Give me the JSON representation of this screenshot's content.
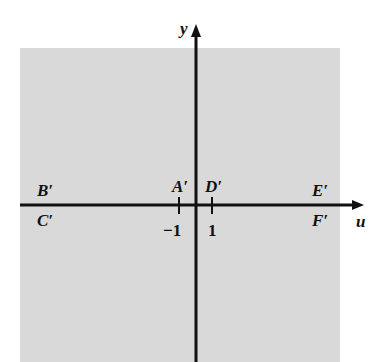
{
  "diagram": {
    "title": "",
    "region": {
      "color": "#d9d9d9"
    },
    "axes": {
      "horizontal_label": "u",
      "vertical_label": "y"
    },
    "ticks": [
      {
        "label": "−1",
        "value": -1
      },
      {
        "label": "1",
        "value": 1
      }
    ],
    "points": {
      "B": "B′",
      "C": "C′",
      "A": "A′",
      "D": "D′",
      "E": "E′",
      "F": "F′"
    }
  }
}
